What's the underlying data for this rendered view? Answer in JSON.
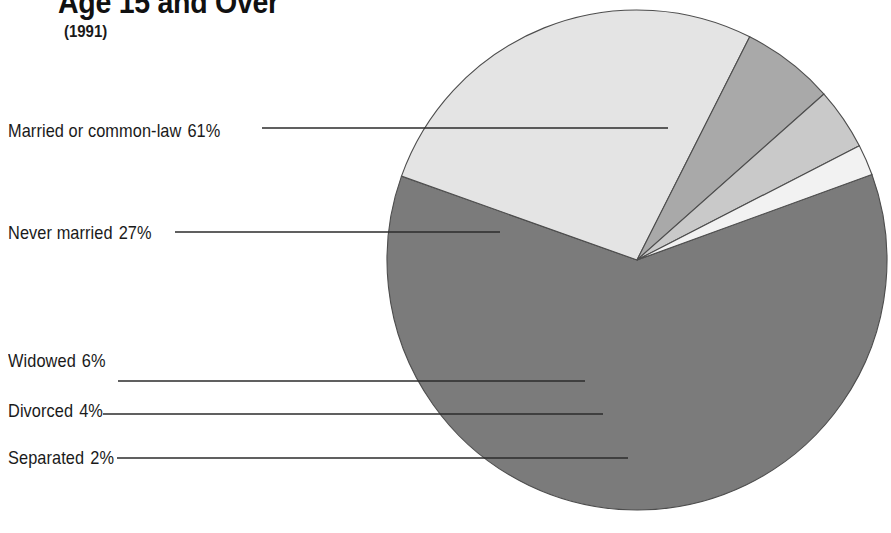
{
  "header": {
    "title": "Age 15 and Over",
    "subtitle": "(1991)"
  },
  "colors": {
    "married": "#7b7b7b",
    "never_married": "#e4e4e4",
    "widowed": "#a9a9a9",
    "divorced": "#c9c9c9",
    "separated": "#f2f2f2",
    "outline": "#4d4d4d",
    "leader_line": "#2b2b2b",
    "text": "#1a1a1a",
    "background": "#ffffff"
  },
  "labels": {
    "married": {
      "name": "Married or common-law",
      "value": "61%"
    },
    "never_married": {
      "name": "Never married",
      "value": "27%"
    },
    "widowed": {
      "name": "Widowed",
      "value": "6%"
    },
    "divorced": {
      "name": "Divorced",
      "value": "4%"
    },
    "separated": {
      "name": "Separated",
      "value": "2%"
    }
  },
  "chart_data": {
    "type": "pie",
    "title": "Age 15 and Over",
    "subtitle": "(1991)",
    "unit": "percent",
    "categories": [
      "Married or common-law",
      "Never married",
      "Widowed",
      "Divorced",
      "Separated"
    ],
    "values": [
      61,
      27,
      6,
      4,
      2
    ],
    "labels": [
      "Married or common-law  61%",
      "Never married  27%",
      "Widowed  6%",
      "Divorced  4%",
      "Separated  2%"
    ],
    "slice_colors": [
      "#7b7b7b",
      "#e4e4e4",
      "#a9a9a9",
      "#c9c9c9",
      "#f2f2f2"
    ],
    "legend": "leader-line labels at left",
    "grid": false,
    "start_angle_deg": -20,
    "direction": "clockwise",
    "center": [
      637,
      260
    ],
    "radius": 250
  }
}
